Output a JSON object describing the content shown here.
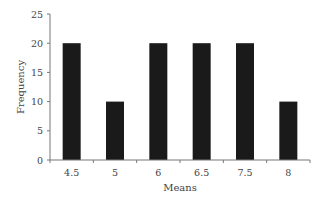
{
  "chart_data": {
    "type": "bar",
    "title": "",
    "xlabel": "Means",
    "ylabel": "Frequency",
    "categories": [
      "4.5",
      "5",
      "6",
      "6.5",
      "7.5",
      "8"
    ],
    "values": [
      20,
      10,
      20,
      20,
      20,
      10
    ],
    "ylim": [
      0,
      25
    ],
    "yticks": [
      0,
      5,
      10,
      15,
      20,
      25
    ],
    "grid": false,
    "legend": null,
    "bar_color": "#1a1a1a"
  }
}
